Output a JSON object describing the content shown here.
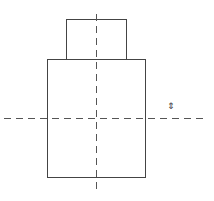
{
  "diagram": {
    "type": "technical-drawing",
    "colors": {
      "stroke": "#444444",
      "centerline": "#555555",
      "background": "#ffffff"
    },
    "shapes": {
      "top_rect": {
        "x": 66,
        "y": 19,
        "w": 60,
        "h": 40
      },
      "main_rect": {
        "x": 47,
        "y": 59,
        "w": 98,
        "h": 118
      }
    },
    "centerlines": {
      "vertical": {
        "x": 96,
        "y1": 14,
        "y2": 192
      },
      "horizontal": {
        "y": 118,
        "x1": 4,
        "x2": 206
      }
    },
    "marker": {
      "symbol": "⇕",
      "x": 167,
      "y": 102
    }
  }
}
